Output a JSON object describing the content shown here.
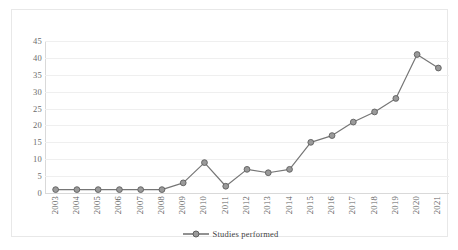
{
  "chart_data": {
    "type": "line",
    "title": "",
    "xlabel": "",
    "ylabel": "",
    "categories": [
      "2003",
      "2004",
      "2005",
      "2006",
      "2007",
      "2008",
      "2009",
      "2010",
      "2011",
      "2012",
      "2013",
      "2014",
      "2015",
      "2016",
      "2017",
      "2018",
      "2019",
      "2020",
      "2021"
    ],
    "values": [
      1,
      1,
      1,
      1,
      1,
      1,
      3,
      9,
      2,
      7,
      6,
      7,
      15,
      17,
      21,
      24,
      28,
      41,
      37
    ],
    "series": [
      {
        "name": "Studies performed",
        "values": [
          1,
          1,
          1,
          1,
          1,
          1,
          3,
          9,
          2,
          7,
          6,
          7,
          15,
          17,
          21,
          24,
          28,
          41,
          37
        ]
      }
    ],
    "ylim": [
      0,
      45
    ],
    "yticks": [
      0,
      5,
      10,
      15,
      20,
      25,
      30,
      35,
      40,
      45
    ],
    "ytick_labels": [
      "0",
      "5",
      "10",
      "15",
      "20",
      "25",
      "30",
      "35",
      "40",
      "45"
    ],
    "grid": true,
    "grid_axis": "y",
    "legend": {
      "position": "bottom-center",
      "entries": [
        "Studies performed"
      ]
    },
    "colors": {
      "series_line": "#767676",
      "marker_fill": "#9a9a9a",
      "marker_edge": "#5e5e5e",
      "gridline": "#efefef",
      "axis": "#d9d9d9",
      "tick_text": "#5f5f5f",
      "frame_border": "#e8e8e8",
      "background": "#ffffff"
    },
    "marker": "circle"
  },
  "legend": {
    "label": "Studies performed"
  }
}
